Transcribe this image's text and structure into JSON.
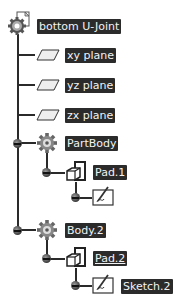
{
  "tree": {
    "root": {
      "label": "bottom U-Joint",
      "icon": "part-gear-icon"
    },
    "planes": [
      {
        "label": "xy plane",
        "icon": "plane-icon"
      },
      {
        "label": "yz plane",
        "icon": "plane-icon"
      },
      {
        "label": "zx plane",
        "icon": "plane-icon"
      }
    ],
    "bodies": [
      {
        "label": "PartBody",
        "icon": "body-gear-icon",
        "pad": {
          "label": "Pad.1",
          "icon": "pad-icon"
        },
        "sketch": {
          "label": "",
          "icon": "sketch-icon"
        }
      },
      {
        "label": "Body.2",
        "icon": "body-gear-icon",
        "pad": {
          "label": "Pad.2",
          "icon": "pad-icon",
          "underlined": true
        },
        "sketch": {
          "label": "Sketch.2",
          "icon": "sketch-icon"
        }
      }
    ]
  },
  "colors": {
    "label_bg": "#2b2b2b",
    "label_fg": "#f2f2f2",
    "line": "#2a2a2a"
  }
}
